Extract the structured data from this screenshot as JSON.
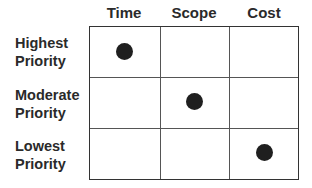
{
  "diagram": {
    "columns": [
      "Time",
      "Scope",
      "Cost"
    ],
    "rows": [
      {
        "line1": "Highest",
        "line2": "Priority"
      },
      {
        "line1": "Moderate",
        "line2": "Priority"
      },
      {
        "line1": "Lowest",
        "line2": "Priority"
      }
    ],
    "marks": [
      {
        "row": "Highest Priority",
        "column": "Time"
      },
      {
        "row": "Moderate Priority",
        "column": "Scope"
      },
      {
        "row": "Lowest Priority",
        "column": "Cost"
      }
    ],
    "dot_color": "#1f1f1f",
    "line_color": "#333333"
  }
}
